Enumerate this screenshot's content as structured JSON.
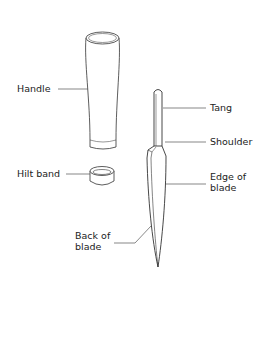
{
  "diagram": {
    "title": "",
    "labels": {
      "handle": "Handle",
      "hilt_band": "Hilt band",
      "tang": "Tang",
      "shoulder": "Shoulder",
      "edge_of_blade_line1": "Edge of",
      "edge_of_blade_line2": "blade",
      "back_of_blade_line1": "Back of",
      "back_of_blade_line2": "blade"
    },
    "colors": {
      "stroke": "#333333",
      "leader": "#555555",
      "text": "#222222",
      "background": "#ffffff"
    }
  }
}
